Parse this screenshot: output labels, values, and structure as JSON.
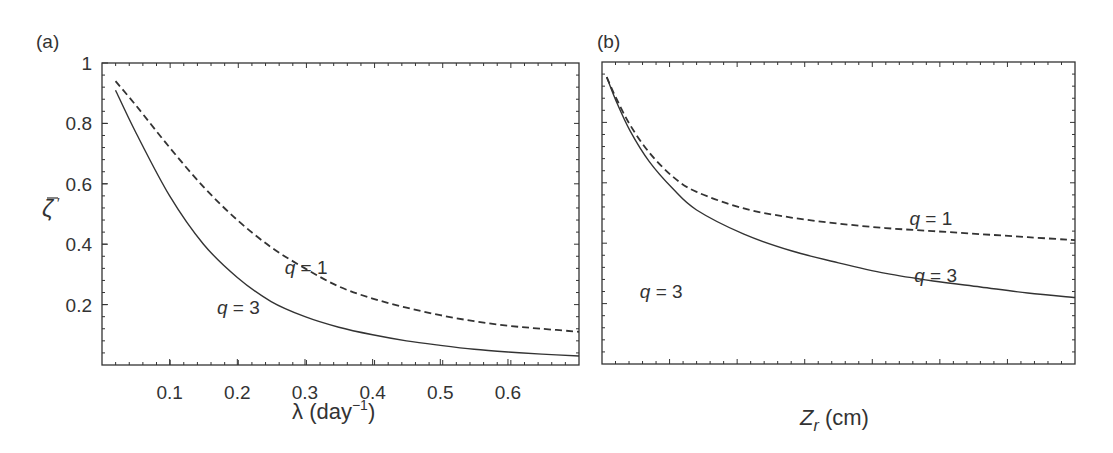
{
  "figure": {
    "panels": [
      {
        "label": "(a)"
      },
      {
        "label": "(b)"
      }
    ]
  },
  "chart_data": [
    {
      "type": "line",
      "panel": "(a)",
      "title": "",
      "xlabel": "λ (day⁻¹)",
      "xlabel_parts": {
        "symbol": "λ",
        "unit": "(day",
        "sup": "−1",
        "close": ")"
      },
      "ylabel": "ζ̄'",
      "xlim": [
        0,
        0.705
      ],
      "ylim": [
        0,
        1
      ],
      "xticks": [
        0.1,
        0.2,
        0.3,
        0.4,
        0.5,
        0.6
      ],
      "xtick_labels": [
        "0.1",
        "0.2",
        "0.3",
        "0.4",
        "0.5",
        "0.6"
      ],
      "yticks": [
        0.2,
        0.4,
        0.6,
        0.8,
        1.0
      ],
      "ytick_labels": [
        "0.2",
        "0.4",
        "0.6",
        "0.8",
        "1"
      ],
      "grid": false,
      "legend": "none (inline annotations)",
      "annotations": [
        {
          "text_var": "q",
          "text_rest": " = 1",
          "x": 0.27,
          "y": 0.3
        },
        {
          "text_var": "q",
          "text_rest": " = 3",
          "x": 0.17,
          "y": 0.17
        }
      ],
      "series": [
        {
          "name": "q = 1",
          "style": "dashed",
          "x": [
            0.02,
            0.05,
            0.1,
            0.15,
            0.2,
            0.25,
            0.3,
            0.35,
            0.4,
            0.45,
            0.5,
            0.55,
            0.6,
            0.65,
            0.705
          ],
          "y": [
            0.94,
            0.86,
            0.72,
            0.59,
            0.48,
            0.39,
            0.32,
            0.26,
            0.22,
            0.19,
            0.165,
            0.145,
            0.13,
            0.12,
            0.11
          ]
        },
        {
          "name": "q = 3",
          "style": "solid",
          "x": [
            0.02,
            0.05,
            0.1,
            0.15,
            0.2,
            0.25,
            0.3,
            0.35,
            0.4,
            0.45,
            0.5,
            0.55,
            0.6,
            0.65,
            0.705
          ],
          "y": [
            0.91,
            0.77,
            0.56,
            0.4,
            0.29,
            0.21,
            0.16,
            0.125,
            0.1,
            0.08,
            0.065,
            0.052,
            0.043,
            0.036,
            0.03
          ]
        }
      ]
    },
    {
      "type": "line",
      "panel": "(b)",
      "title": "",
      "xlabel": "Z_r (cm)",
      "xlabel_parts": {
        "symbol": "Z",
        "sub": "r",
        "unit": " (cm)"
      },
      "ylabel": "",
      "xlim": [
        0,
        1
      ],
      "ylim": [
        0,
        1
      ],
      "xticks": [],
      "xtick_labels": [],
      "yticks": [],
      "ytick_labels": [],
      "grid": false,
      "legend": "none (inline annotations)",
      "annotations": [
        {
          "text_var": "q",
          "text_rest": " = 1",
          "x": 0.65,
          "y": 0.46
        },
        {
          "text_var": "q",
          "text_rest": " = 3",
          "x": 0.66,
          "y": 0.27
        },
        {
          "text_var": "q",
          "text_rest": " = 3",
          "x": 0.08,
          "y": 0.22
        }
      ],
      "series": [
        {
          "name": "q = 1",
          "style": "dashed",
          "x": [
            0.01,
            0.03,
            0.06,
            0.1,
            0.15,
            0.2,
            0.3,
            0.4,
            0.5,
            0.6,
            0.7,
            0.8,
            0.9,
            1.0
          ],
          "y": [
            0.95,
            0.88,
            0.79,
            0.7,
            0.62,
            0.57,
            0.515,
            0.485,
            0.465,
            0.45,
            0.44,
            0.43,
            0.42,
            0.41
          ]
        },
        {
          "name": "q = 3",
          "style": "solid",
          "x": [
            0.01,
            0.03,
            0.06,
            0.1,
            0.15,
            0.2,
            0.3,
            0.4,
            0.5,
            0.6,
            0.7,
            0.8,
            0.9,
            1.0
          ],
          "y": [
            0.95,
            0.87,
            0.77,
            0.67,
            0.58,
            0.51,
            0.43,
            0.375,
            0.335,
            0.3,
            0.275,
            0.255,
            0.235,
            0.22
          ]
        }
      ]
    }
  ]
}
